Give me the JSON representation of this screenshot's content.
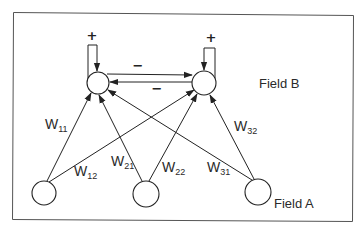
{
  "diagram": {
    "title": "",
    "fields": {
      "field_b": {
        "label": "Field B",
        "node_count": 2
      },
      "field_a": {
        "label": "Field A",
        "node_count": 3
      }
    },
    "nodes": {
      "b1": {
        "field": "Field B",
        "index": 1
      },
      "b2": {
        "field": "Field B",
        "index": 2
      },
      "a1": {
        "field": "Field A",
        "index": 1
      },
      "a2": {
        "field": "Field A",
        "index": 2
      },
      "a3": {
        "field": "Field A",
        "index": 3
      }
    },
    "self_loops": {
      "b1": {
        "sign": "+"
      },
      "b2": {
        "sign": "+"
      }
    },
    "lateral": {
      "b1_to_b2": {
        "sign": "−"
      },
      "b2_to_b1": {
        "sign": "−"
      }
    },
    "weights": {
      "w11": {
        "base": "W",
        "sub": "11",
        "from": "a1",
        "to": "b1"
      },
      "w12": {
        "base": "W",
        "sub": "12",
        "from": "a1",
        "to": "b2"
      },
      "w21": {
        "base": "W",
        "sub": "21",
        "from": "a2",
        "to": "b1"
      },
      "w22": {
        "base": "W",
        "sub": "22",
        "from": "a2",
        "to": "b2"
      },
      "w31": {
        "base": "W",
        "sub": "31",
        "from": "a3",
        "to": "b1"
      },
      "w32": {
        "base": "W",
        "sub": "32",
        "from": "a3",
        "to": "b2"
      }
    },
    "colors": {
      "stroke": "#222222",
      "text": "#2a2a2a",
      "frame": "#555555",
      "background": "#ffffff"
    }
  }
}
